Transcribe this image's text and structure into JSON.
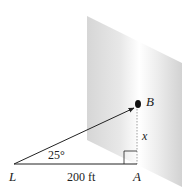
{
  "diagram": {
    "labels": {
      "point_L": "L",
      "point_A": "A",
      "point_B": "B",
      "height": "x",
      "angle": "25°",
      "distance": "200 ft"
    },
    "colors": {
      "wall_light": "#ffffff",
      "wall_shade": "#d4d4d4",
      "line": "#222222",
      "dashed": "#888888"
    }
  }
}
